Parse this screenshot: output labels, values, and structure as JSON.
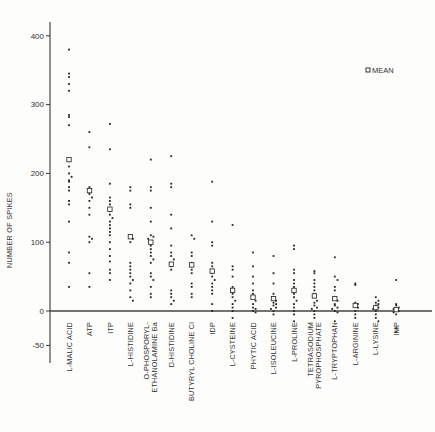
{
  "chart_data": {
    "type": "scatter",
    "title": "",
    "xlabel": "",
    "ylabel": "NUMBER OF SPIKES",
    "ylim": [
      -70,
      420
    ],
    "yticks": [
      400,
      300,
      200,
      100,
      0,
      -50
    ],
    "grid": false,
    "legend": {
      "position": "upper-right",
      "entries": [
        {
          "marker": "open-square",
          "label": "MEAN"
        }
      ]
    },
    "categories": [
      "L-MALIC ACID",
      "ATP",
      "ITP",
      "L-HISTIDINE",
      "O-PHOSPORYL-\nETHANOLAMINE Ba",
      "D-HISTIDINE",
      "BUTYRYL CHOLINE Cl",
      "IDP",
      "L-CYSTEINE",
      "PHYTIC ACID",
      "L-ISOLEUCINE",
      "L-PROLINE",
      "TETRASODIUM\nPYROPHOSPHATE",
      "L-TRYPTOPHAN",
      "L-ARGININE",
      "L-LYSINE",
      "IMP"
    ],
    "series": [
      {
        "name": "L-MALIC ACID",
        "mean": 220,
        "points": [
          380,
          345,
          340,
          330,
          320,
          285,
          282,
          270,
          218,
          210,
          200,
          195,
          190,
          188,
          180,
          175,
          160,
          155,
          130,
          85,
          70,
          35
        ]
      },
      {
        "name": "ATP",
        "mean": 175,
        "points": [
          260,
          238,
          180,
          175,
          170,
          165,
          160,
          150,
          140,
          108,
          105,
          100,
          55,
          35
        ]
      },
      {
        "name": "ITP",
        "mean": 148,
        "points": [
          272,
          235,
          185,
          165,
          160,
          155,
          150,
          145,
          140,
          135,
          130,
          125,
          120,
          115,
          110,
          100,
          90,
          80,
          72,
          60,
          55,
          45
        ]
      },
      {
        "name": "L-HISTIDINE",
        "mean": 108,
        "points": [
          180,
          175,
          155,
          150,
          110,
          105,
          100,
          70,
          65,
          60,
          55,
          50,
          45,
          40,
          30,
          20,
          15
        ]
      },
      {
        "name": "O-PHOSPORYL-ETHANOLAMINE Ba",
        "mean": 100,
        "points": [
          220,
          180,
          175,
          150,
          130,
          110,
          108,
          105,
          100,
          95,
          90,
          85,
          80,
          75,
          70,
          55,
          50,
          45,
          35,
          25,
          20
        ]
      },
      {
        "name": "D-HISTIDINE",
        "mean": 68,
        "points": [
          225,
          185,
          180,
          140,
          120,
          95,
          85,
          80,
          75,
          70,
          65,
          60,
          30,
          25,
          20,
          15,
          10
        ]
      },
      {
        "name": "BUTYRYL CHOLINE Cl",
        "mean": 67,
        "points": [
          110,
          105,
          85,
          80,
          70,
          65,
          60,
          55,
          40,
          35,
          25,
          20
        ]
      },
      {
        "name": "IDP",
        "mean": 58,
        "points": [
          188,
          130,
          100,
          95,
          70,
          65,
          60,
          55,
          50,
          45,
          40,
          35,
          30,
          25,
          10,
          0
        ]
      },
      {
        "name": "L-CYSTEINE",
        "mean": 30,
        "points": [
          125,
          65,
          60,
          50,
          35,
          30,
          25,
          20,
          15,
          10,
          5,
          0,
          -10
        ]
      },
      {
        "name": "PHYTIC ACID",
        "mean": 20,
        "points": [
          85,
          65,
          50,
          40,
          30,
          25,
          20,
          15,
          10,
          5,
          3,
          0,
          -2
        ]
      },
      {
        "name": "L-ISOLEUCINE",
        "mean": 18,
        "points": [
          80,
          55,
          40,
          25,
          20,
          15,
          12,
          10,
          8,
          5,
          3,
          0,
          -5
        ]
      },
      {
        "name": "L-PROLINE",
        "mean": 30,
        "points": [
          95,
          90,
          60,
          55,
          45,
          40,
          35,
          30,
          25,
          20,
          15,
          10,
          5,
          0,
          -5,
          -15
        ]
      },
      {
        "name": "TETRASODIUM PYROPHOSPHATE",
        "mean": 22,
        "points": [
          58,
          55,
          45,
          40,
          35,
          30,
          25,
          20,
          15,
          12,
          8,
          5,
          3,
          0,
          -5,
          -10
        ]
      },
      {
        "name": "L-TRYPTOPHAN",
        "mean": 18,
        "points": [
          78,
          50,
          45,
          35,
          30,
          20,
          15,
          10,
          8,
          5,
          3,
          0,
          -2,
          -15
        ]
      },
      {
        "name": "L-ARGININE",
        "mean": 8,
        "points": [
          40,
          38,
          12,
          10,
          8,
          5,
          0,
          -5,
          -10
        ]
      },
      {
        "name": "L-LYSINE",
        "mean": 5,
        "points": [
          20,
          15,
          12,
          10,
          8,
          5,
          3,
          0,
          -5,
          -10,
          -15
        ]
      },
      {
        "name": "IMP",
        "mean": 2,
        "points": [
          45,
          10,
          8,
          5,
          3,
          2,
          0,
          -2,
          -5,
          -25,
          -30
        ]
      }
    ]
  },
  "axis": {
    "ylabel": "NUMBER OF SPIKES",
    "ticks": [
      {
        "value": 400,
        "label": "400"
      },
      {
        "value": 300,
        "label": "300"
      },
      {
        "value": 200,
        "label": "200"
      },
      {
        "value": 100,
        "label": "100"
      },
      {
        "value": 0,
        "label": "0"
      },
      {
        "value": -50,
        "label": "-50"
      }
    ]
  },
  "legend": {
    "label": "MEAN"
  },
  "colors": {
    "ink": "#222222",
    "paper": "#fdfdfb"
  }
}
